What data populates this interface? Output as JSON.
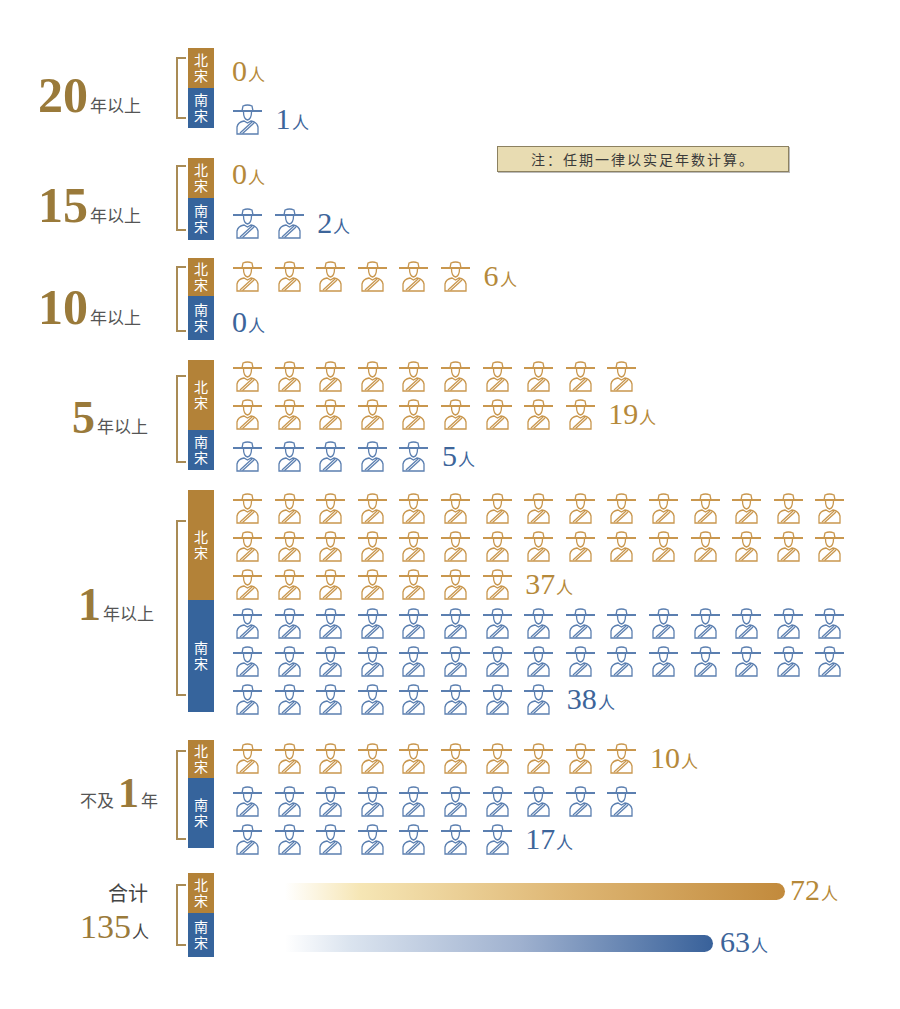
{
  "note": "注：任期一律以实足年数计算。",
  "colors": {
    "north_song": "#b38238",
    "south_song": "#36649c",
    "label_gold": "#9a7a3a",
    "note_bg": "#e8dcb2"
  },
  "legend": {
    "north": "北宋",
    "south": "南宋"
  },
  "icon": "official-with-hat-icon",
  "unit": "人",
  "categories": [
    {
      "id": "20plus",
      "big": "20",
      "small": "年以上",
      "north": 0,
      "south": 1
    },
    {
      "id": "15plus",
      "big": "15",
      "small": "年以上",
      "north": 0,
      "south": 2
    },
    {
      "id": "10plus",
      "big": "10",
      "small": "年以上",
      "north": 6,
      "south": 0
    },
    {
      "id": "5plus",
      "big": "5",
      "small": "年以上",
      "north": 19,
      "south": 5
    },
    {
      "id": "1plus",
      "big": "1",
      "small": "年以上",
      "north": 37,
      "south": 38
    },
    {
      "id": "lt1",
      "prefix": "不及",
      "big": "1",
      "small": "年",
      "north": 10,
      "south": 17
    }
  ],
  "total": {
    "label": "合计",
    "value": "135",
    "unit": "人",
    "north": 72,
    "south": 63
  },
  "chart_data": {
    "type": "bar",
    "title": "",
    "note": "注：任期一律以实足年数计算。",
    "categories": [
      "20年以上",
      "15年以上",
      "10年以上",
      "5年以上",
      "1年以上",
      "不及1年"
    ],
    "series": [
      {
        "name": "北宋",
        "values": [
          0,
          0,
          6,
          19,
          37,
          10
        ],
        "total": 72
      },
      {
        "name": "南宋",
        "values": [
          1,
          2,
          0,
          5,
          38,
          17
        ],
        "total": 63
      }
    ],
    "grand_total": 135,
    "unit": "人",
    "encoding": "pictogram (one icon per person), totals shown as gradient horizontal bars",
    "xlabel": "",
    "ylabel": ""
  }
}
